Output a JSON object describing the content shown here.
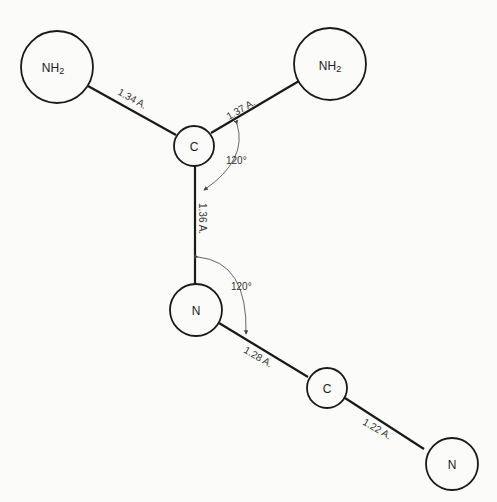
{
  "diagram": {
    "type": "molecular-structure",
    "atoms": [
      {
        "id": "nh2_left",
        "label": "NH",
        "sub": "2"
      },
      {
        "id": "nh2_right",
        "label": "NH",
        "sub": "2"
      },
      {
        "id": "c_top",
        "label": "C"
      },
      {
        "id": "n_mid",
        "label": "N"
      },
      {
        "id": "c_bottom",
        "label": "C"
      },
      {
        "id": "n_end",
        "label": "N"
      }
    ],
    "bonds": [
      {
        "from": "nh2_left",
        "to": "c_top",
        "length": "1.34 A."
      },
      {
        "from": "c_top",
        "to": "nh2_right",
        "length": "1.37 A."
      },
      {
        "from": "c_top",
        "to": "n_mid",
        "length": "1.36 A."
      },
      {
        "from": "n_mid",
        "to": "c_bottom",
        "length": "1.28 A."
      },
      {
        "from": "c_bottom",
        "to": "n_end",
        "length": "1.22 A."
      }
    ],
    "angles": [
      {
        "at": "c_top",
        "value": "120°"
      },
      {
        "at": "n_mid",
        "value": "120°"
      }
    ],
    "colors": {
      "line": "#1a1a1a",
      "background": "#fbfbf9"
    }
  }
}
